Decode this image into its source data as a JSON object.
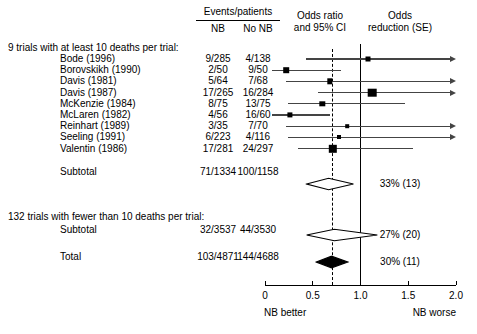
{
  "header": {
    "events_patients": "Events/patients",
    "col_nb": "NB",
    "col_no_nb": "No NB",
    "odds_ratio_line1": "Odds ratio",
    "odds_ratio_line2": "and 95% CI",
    "odds_reduction_line1": "Odds",
    "odds_reduction_line2": "reduction (SE)"
  },
  "groups": [
    {
      "title": "9 trials with at least 10 deaths per trial:"
    },
    {
      "title": "132 trials with fewer than 10 deaths per trial:"
    }
  ],
  "rows": [
    {
      "label": "Bode (1996)",
      "nb": "9/285",
      "no_nb": "4/138",
      "or": 1.08,
      "ci_low": 0.43,
      "ci_high": 2.35,
      "box": 5.0,
      "arrow_right": true,
      "reduction": ""
    },
    {
      "label": "Borovskikh (1990)",
      "nb": "2/50",
      "no_nb": "9/50",
      "or": 0.22,
      "ci_low": 0.07,
      "ci_high": 0.8,
      "box": 5.6,
      "arrow_right": false,
      "reduction": ""
    },
    {
      "label": "Davis (1981)",
      "nb": "5/64",
      "no_nb": "7/68",
      "or": 0.68,
      "ci_low": 0.22,
      "ci_high": 2.3,
      "box": 5.4,
      "arrow_right": true,
      "reduction": ""
    },
    {
      "label": "Davis (1987)",
      "nb": "17/265",
      "no_nb": "16/284",
      "or": 1.12,
      "ci_low": 0.56,
      "ci_high": 2.3,
      "box": 8.6,
      "arrow_right": true,
      "reduction": ""
    },
    {
      "label": "McKenzie (1984)",
      "nb": "8/75",
      "no_nb": "13/75",
      "or": 0.6,
      "ci_low": 0.24,
      "ci_high": 1.47,
      "box": 5.4,
      "arrow_right": false,
      "reduction": ""
    },
    {
      "label": "McLaren (1982)",
      "nb": "4/56",
      "no_nb": "16/60",
      "or": 0.26,
      "ci_low": 0.07,
      "ci_high": 0.68,
      "box": 5.2,
      "arrow_right": false,
      "reduction": ""
    },
    {
      "label": "Reinhart (1989)",
      "nb": "3/35",
      "no_nb": "7/70",
      "or": 0.86,
      "ci_low": 0.22,
      "ci_high": 2.3,
      "box": 3.6,
      "arrow_right": true,
      "reduction": ""
    },
    {
      "label": "Seeling (1991)",
      "nb": "6/223",
      "no_nb": "4/116",
      "or": 0.77,
      "ci_low": 0.24,
      "ci_high": 2.3,
      "box": 4.0,
      "arrow_right": true,
      "reduction": ""
    },
    {
      "label": "Valentin (1986)",
      "nb": "17/281",
      "no_nb": "24/297",
      "or": 0.71,
      "ci_low": 0.35,
      "ci_high": 1.55,
      "box": 8.4,
      "arrow_right": false,
      "reduction": ""
    }
  ],
  "summaries": [
    {
      "name": "subtotal-large",
      "label": "Subtotal",
      "nb": "71/1334",
      "no_nb": "100/1158",
      "or": 0.67,
      "ci_low": 0.44,
      "ci_high": 0.93,
      "filled": false,
      "reduction": "33% (13)"
    },
    {
      "name": "subtotal-small",
      "label": "Subtotal",
      "nb": "32/3537",
      "no_nb": "44/3530",
      "or": 0.73,
      "ci_low": 0.44,
      "ci_high": 1.18,
      "filled": false,
      "reduction": "27% (20)"
    },
    {
      "name": "total",
      "label": "Total",
      "nb": "103/4871",
      "no_nb": "144/4688",
      "or": 0.7,
      "ci_low": 0.54,
      "ci_high": 0.87,
      "filled": true,
      "reduction": "30% (11)"
    }
  ],
  "axis": {
    "ticks": [
      "0",
      "0.5",
      "1.0",
      "1.5",
      "2.0"
    ],
    "tick_values": [
      0,
      0.5,
      1.0,
      1.5,
      2.0
    ],
    "left_label": "NB better",
    "right_label": "NB worse",
    "null_value": 1.0,
    "pooled_value": 0.7
  },
  "chart_data": {
    "type": "forest",
    "title": "",
    "xlabel": "Odds ratio and 95% CI",
    "xlim": [
      0,
      2.0
    ],
    "null_line": 1.0,
    "pooled_line": 0.7,
    "grid": false,
    "columns": [
      "Study",
      "NB events/patients",
      "No NB events/patients",
      "Odds ratio and 95% CI",
      "Odds reduction (SE)"
    ],
    "groups": [
      {
        "title": "9 trials with at least 10 deaths per trial:",
        "studies": [
          {
            "label": "Bode (1996)",
            "nb": "9/285",
            "no_nb": "4/138",
            "or": 1.08,
            "ci": [
              0.43,
              2.35
            ]
          },
          {
            "label": "Borovskikh (1990)",
            "nb": "2/50",
            "no_nb": "9/50",
            "or": 0.22,
            "ci": [
              0.07,
              0.8
            ]
          },
          {
            "label": "Davis (1981)",
            "nb": "5/64",
            "no_nb": "7/68",
            "or": 0.68,
            "ci": [
              0.22,
              2.3
            ]
          },
          {
            "label": "Davis (1987)",
            "nb": "17/265",
            "no_nb": "16/284",
            "or": 1.12,
            "ci": [
              0.56,
              2.3
            ]
          },
          {
            "label": "McKenzie (1984)",
            "nb": "8/75",
            "no_nb": "13/75",
            "or": 0.6,
            "ci": [
              0.24,
              1.47
            ]
          },
          {
            "label": "McLaren (1982)",
            "nb": "4/56",
            "no_nb": "16/60",
            "or": 0.26,
            "ci": [
              0.07,
              0.68
            ]
          },
          {
            "label": "Reinhart (1989)",
            "nb": "3/35",
            "no_nb": "7/70",
            "or": 0.86,
            "ci": [
              0.22,
              2.3
            ]
          },
          {
            "label": "Seeling (1991)",
            "nb": "6/223",
            "no_nb": "4/116",
            "or": 0.77,
            "ci": [
              0.24,
              2.3
            ]
          },
          {
            "label": "Valentin (1986)",
            "nb": "17/281",
            "no_nb": "24/297",
            "or": 0.71,
            "ci": [
              0.35,
              1.55
            ]
          }
        ],
        "subtotal": {
          "label": "Subtotal",
          "nb": "71/1334",
          "no_nb": "100/1158",
          "or": 0.67,
          "ci": [
            0.44,
            0.93
          ],
          "odds_reduction": "33% (13)"
        }
      },
      {
        "title": "132 trials with fewer than 10 deaths per trial:",
        "studies": [],
        "subtotal": {
          "label": "Subtotal",
          "nb": "32/3537",
          "no_nb": "44/3530",
          "or": 0.73,
          "ci": [
            0.44,
            1.18
          ],
          "odds_reduction": "27% (20)"
        }
      }
    ],
    "total": {
      "label": "Total",
      "nb": "103/4871",
      "no_nb": "144/4688",
      "or": 0.7,
      "ci": [
        0.54,
        0.87
      ],
      "odds_reduction": "30% (11)"
    },
    "xticks": [
      0,
      0.5,
      1.0,
      1.5,
      2.0
    ],
    "xticklabels": [
      "0",
      "0.5",
      "1.0",
      "1.5",
      "2.0"
    ],
    "annotations": [
      "NB better",
      "NB worse"
    ]
  }
}
